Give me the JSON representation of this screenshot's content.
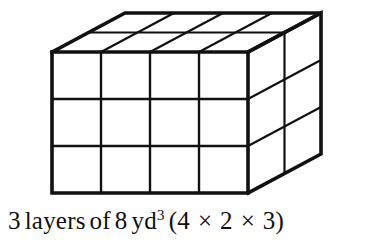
{
  "figure": {
    "name": "rectangular-prism-unit-cubes",
    "stroke_color": "#111111",
    "background_color": "#ffffff",
    "outer_stroke_width": 3.6,
    "inner_stroke_width": 2.2,
    "geometry": {
      "front_face": {
        "left_x": 52,
        "right_x": 248,
        "top_y": 52,
        "bottom_y": 193,
        "columns": 4,
        "rows": 3,
        "column_x": [
          52,
          101,
          150,
          199,
          248
        ],
        "row_y": [
          52,
          99,
          146,
          193
        ]
      },
      "depth_offset": {
        "dx": 73,
        "dy": -39
      },
      "depth_divisions": 2,
      "depth_fractions": [
        0,
        0.5,
        1
      ],
      "back_top_left": {
        "x": 125,
        "y": 13
      },
      "back_top_right": {
        "x": 321,
        "y": 13
      },
      "back_bottom_right": {
        "x": 321,
        "y": 154
      }
    },
    "dimensions": {
      "width_units": 4,
      "depth_units": 2,
      "height_units": 3,
      "total_unit_cubes": 24,
      "cubes_per_layer": 8,
      "layers": 3
    }
  },
  "caption": {
    "full_text": "3 layers of 8 yd3 (4 × 2 × 3)",
    "layers_count": "3",
    "layers_word": "layers",
    "of_word": "of",
    "per_layer_count": "8",
    "unit": "yd",
    "unit_exponent": "3",
    "open_paren": "(",
    "dim_width": "4",
    "times_1": "×",
    "dim_depth": "2",
    "times_2": "×",
    "dim_height": "3",
    "close_paren": ")"
  }
}
